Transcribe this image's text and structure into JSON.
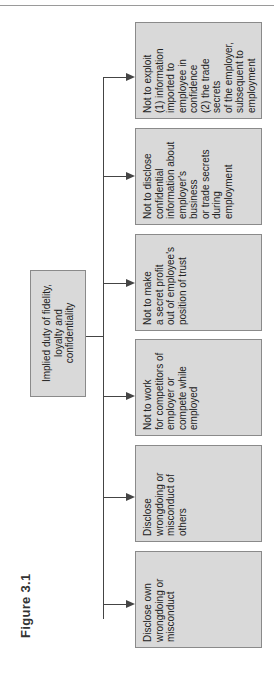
{
  "figure": {
    "title": "Figure 3.1"
  },
  "root": {
    "label": "Implied duty of fidelity,\nloyalty and confidentiality"
  },
  "children": [
    {
      "label": "Disclose own\nwrongdoing or\nmisconduct"
    },
    {
      "label": "Disclose\nwrongdoing or\nmisconduct of\nothers"
    },
    {
      "label": "Not to work\nfor competitors of\nemployer or\ncompete while\nemployed"
    },
    {
      "label": "Not to make\na secret profit\nout of employee's\nposition of trust"
    },
    {
      "label": "Not to disclose\nconfidential\ninformation about\nemployer's business\nor trade secrets\nduring employment"
    },
    {
      "label": "Not to exploit\n(1) information\nimported to\nemployee in\nconfidence\n(2) the trade secrets\nof the employer,\nsubsequent to\nemployment"
    }
  ],
  "colors": {
    "box_fill": "#d9d9d9",
    "box_border": "#8a8a8a",
    "line": "#444444"
  }
}
